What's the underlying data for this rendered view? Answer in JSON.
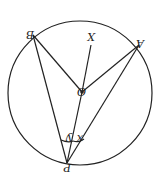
{
  "diagram": {
    "orientation": "rotated 180 degrees",
    "labels": {
      "A": "A",
      "B": "B",
      "X": "X",
      "O": "O",
      "P": "P",
      "angle_x": "x",
      "angle_y": "y"
    },
    "colors": {
      "stroke": "#222222",
      "background": "#ffffff"
    }
  }
}
